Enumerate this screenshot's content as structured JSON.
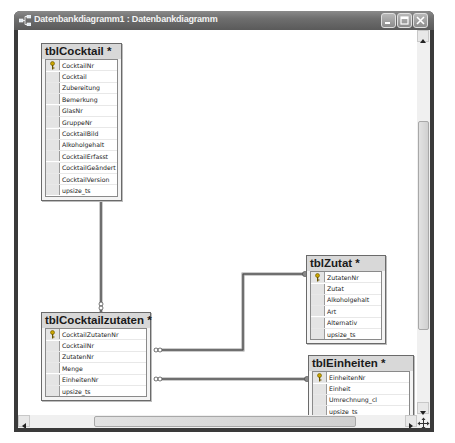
{
  "window": {
    "title": "Datenbankdiagramm1 : Datenbankdiagramm",
    "icon": "diagram-icon",
    "buttons": [
      {
        "name": "minimize",
        "icon": "minimize-icon"
      },
      {
        "name": "maximize",
        "icon": "maximize-icon"
      },
      {
        "name": "close",
        "icon": "close-icon"
      }
    ]
  },
  "tables": [
    {
      "name": "tblCocktail *",
      "columns": [
        "CocktailNr",
        "Cocktail",
        "Zubereitung",
        "Bemerkung",
        "GlasNr",
        "GruppeNr",
        "CocktailBild",
        "Alkoholgehalt",
        "CocktailErfasst",
        "CocktailGeändert",
        "CocktailVersion",
        "upsize_ts"
      ],
      "primary_key": "CocktailNr"
    },
    {
      "name": "tblCocktailzutaten *",
      "columns": [
        "CocktailZutatenNr",
        "CocktailNr",
        "ZutatenNr",
        "Menge",
        "EinheitenNr",
        "upsize_ts"
      ],
      "primary_key": "CocktailZutatenNr"
    },
    {
      "name": "tblZutat *",
      "columns": [
        "ZutatenNr",
        "Zutat",
        "Alkoholgehalt",
        "Art",
        "Alternativ",
        "upsize_ts"
      ],
      "primary_key": "ZutatenNr"
    },
    {
      "name": "tblEinheiten *",
      "columns": [
        "EinheitenNr",
        "Einheit",
        "Umrechnung_cl",
        "upsize_ts"
      ],
      "primary_key": "EinheitenNr"
    }
  ],
  "relationships": [
    {
      "from": "tblCocktail.CocktailNr",
      "to": "tblCocktailzutaten.CocktailNr",
      "type": "one-to-many"
    },
    {
      "from": "tblZutat.ZutatenNr",
      "to": "tblCocktailzutaten.ZutatenNr",
      "type": "one-to-many"
    },
    {
      "from": "tblEinheiten.EinheitenNr",
      "to": "tblCocktailzutaten.EinheitenNr",
      "type": "one-to-many"
    }
  ],
  "scrollbars": {
    "vertical": {
      "position": 0.22,
      "visible_fraction": 0.58
    },
    "horizontal": {
      "position": 0.17,
      "visible_fraction": 0.7
    }
  }
}
